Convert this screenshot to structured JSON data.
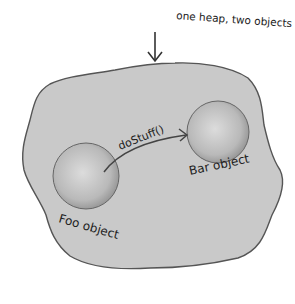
{
  "diagram": {
    "annotation": "one heap, two objects",
    "method_call": "doStuff()",
    "objects": [
      {
        "label": "Foo object"
      },
      {
        "label": "Bar object"
      }
    ],
    "colors": {
      "heap_fill": "#c9c9c9",
      "heap_stroke": "#555555",
      "object_fill": "#bdbdbd",
      "background": "#ffffff"
    }
  }
}
